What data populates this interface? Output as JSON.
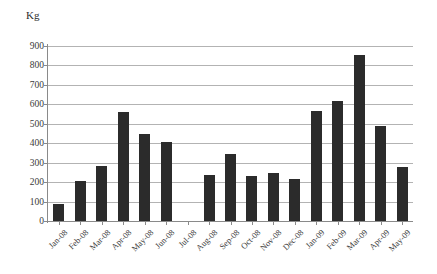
{
  "chart_data": {
    "type": "bar",
    "title": "",
    "subtitle": "",
    "xlabel": "",
    "ylabel": "Kg",
    "ylim": [
      0,
      900
    ],
    "ytick_step": 100,
    "yticks": [
      0,
      100,
      200,
      300,
      400,
      500,
      600,
      700,
      800,
      900
    ],
    "grid": true,
    "legend": false,
    "legend_position": "none",
    "bar_color": "#2b2b2b",
    "gridline_color": "#b3b3b3",
    "axis_color": "#8a8a8a",
    "categories": [
      "Jan-08",
      "Feb-08",
      "Mar-08",
      "Apr-08",
      "May-08",
      "Jun-08",
      "Jul-08",
      "Aug-08",
      "Sep-08",
      "Oct-08",
      "Nov-08",
      "Dec-08",
      "Jan-09",
      "Feb-09",
      "Mar-09",
      "Apr-09",
      "May-09"
    ],
    "values": [
      90,
      205,
      285,
      560,
      450,
      405,
      0,
      235,
      345,
      230,
      245,
      215,
      565,
      615,
      855,
      490,
      280
    ]
  }
}
